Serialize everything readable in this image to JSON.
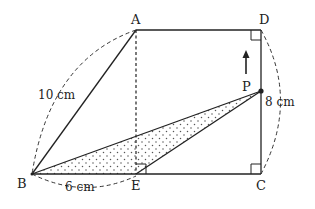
{
  "diagram": {
    "points": {
      "A": {
        "label": "A",
        "x": 136,
        "y": 30
      },
      "D": {
        "label": "D",
        "x": 261,
        "y": 30
      },
      "B": {
        "label": "B",
        "x": 32,
        "y": 174
      },
      "E": {
        "label": "E",
        "x": 136,
        "y": 174
      },
      "C": {
        "label": "C",
        "x": 261,
        "y": 174
      },
      "P": {
        "label": "P",
        "x": 261,
        "y": 91
      }
    },
    "measurements": {
      "AB": "10 cm",
      "BE": "6 cm",
      "DC": "8 cm"
    },
    "shaded_region": "triangle BEP",
    "motion": "P moves upward along CD",
    "colors": {
      "line": "#222222",
      "dots": "#555555",
      "background": "#ffffff"
    }
  }
}
